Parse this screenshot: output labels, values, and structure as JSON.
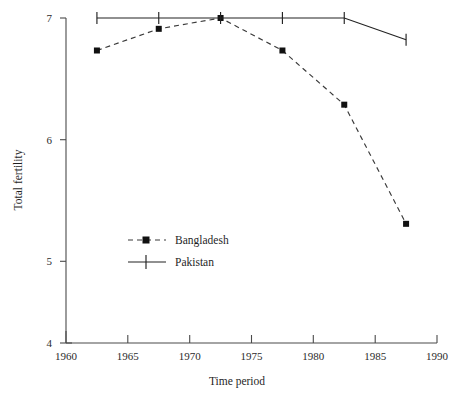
{
  "chart_data": {
    "type": "line",
    "title": "",
    "xlabel": "Time period",
    "ylabel": "Total fertility",
    "xlim": [
      1960,
      1990
    ],
    "ylim": [
      4,
      7
    ],
    "xticks": [
      1960,
      1965,
      1970,
      1975,
      1980,
      1985,
      1990
    ],
    "xtick_labels": [
      "1960",
      "1965",
      "1970",
      "1975",
      "1980",
      "1985",
      "1990"
    ],
    "yticks": [
      4,
      5,
      6,
      7
    ],
    "ytick_labels": [
      "4",
      "5",
      "6",
      "7"
    ],
    "grid": false,
    "legend_position": "center-left",
    "x": [
      1962.5,
      1967.5,
      1972.5,
      1977.5,
      1982.5,
      1987.5
    ],
    "series": [
      {
        "name": "Bangladesh",
        "marker": "square",
        "line_style": "dashed",
        "color": "#3a3a3a",
        "values": [
          6.7,
          6.9,
          7.0,
          6.7,
          6.2,
          5.1
        ]
      },
      {
        "name": "Pakistan",
        "marker": "plus",
        "line_style": "solid",
        "color": "#222222",
        "values": [
          7.0,
          7.0,
          7.0,
          7.0,
          7.0,
          6.8
        ]
      }
    ]
  },
  "legend": {
    "items": [
      {
        "label": "Bangladesh"
      },
      {
        "label": "Pakistan"
      }
    ]
  },
  "axes": {
    "x_title": "Time period",
    "y_title": "Total fertility"
  }
}
